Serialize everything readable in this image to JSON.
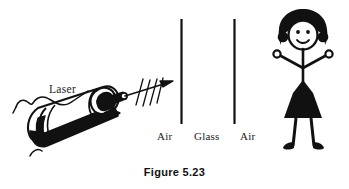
{
  "figure": {
    "caption": "Figure 5.23",
    "background_color": "#ffffff",
    "ink_color": "#111111",
    "width": 349,
    "height": 189
  },
  "diagram": {
    "device": {
      "name": "laser",
      "label": "Laser",
      "leader_line": "curly-bracket-pointer"
    },
    "beam": {
      "name": "laser-beam",
      "style": "arrow-with-wavefront-ticks",
      "tick_count": 4,
      "direction": "right-and-slightly-up"
    },
    "media": [
      {
        "name": "air-left",
        "label": "Air",
        "order": 1
      },
      {
        "name": "glass",
        "label": "Glass",
        "order": 2
      },
      {
        "name": "air-right",
        "label": "Air",
        "order": 3
      }
    ],
    "boundaries": [
      {
        "name": "air-glass-interface",
        "x": 181,
        "y_top": 18,
        "y_bottom": 124
      },
      {
        "name": "glass-air-interface",
        "x": 234,
        "y_top": 18,
        "y_bottom": 124
      }
    ],
    "observer": {
      "name": "stick-figure-girl",
      "description": "girl with bob haircut, smiling face, raised arms with round hands, skirt, legs and shoes"
    }
  }
}
